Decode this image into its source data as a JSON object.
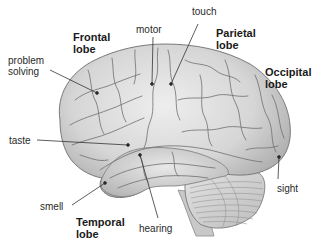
{
  "diagram": {
    "lobes": [
      {
        "id": "frontal",
        "line1": "Frontal",
        "line2": "lobe"
      },
      {
        "id": "parietal",
        "line1": "Parietal",
        "line2": "lobe"
      },
      {
        "id": "occipital",
        "line1": "Occipital",
        "line2": "lobe"
      },
      {
        "id": "temporal",
        "line1": "Temporal",
        "line2": "lobe"
      }
    ],
    "functions": {
      "problem_solving": {
        "line1": "problem",
        "line2": "solving"
      },
      "motor": "motor",
      "touch": "touch",
      "taste": "taste",
      "smell": "smell",
      "hearing": "hearing",
      "sight": "sight"
    },
    "colors": {
      "brain_fill": "#d9d9d9",
      "brain_shadow": "#a8a8a8",
      "sulci": "#6e6e6e",
      "leader_line": "#333333",
      "text": "#222222"
    }
  }
}
